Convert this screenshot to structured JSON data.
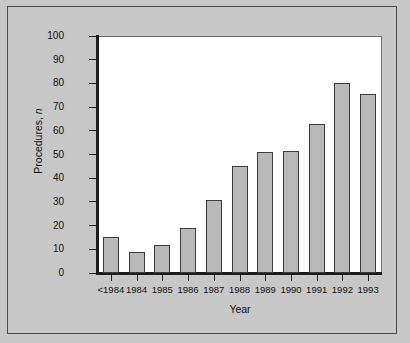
{
  "chart_data": {
    "type": "bar",
    "title": "",
    "xlabel": "Year",
    "ylabel": "Procedures, n",
    "ylabel_prefix": "Procedures, ",
    "ylabel_italic": "n",
    "categories": [
      "<1984",
      "1984",
      "1985",
      "1986",
      "1987",
      "1988",
      "1989",
      "1990",
      "1991",
      "1992",
      "1993"
    ],
    "values": [
      15,
      9,
      12,
      19,
      31,
      45,
      51,
      51.5,
      63,
      80,
      75.5
    ],
    "ylim": [
      0,
      100
    ],
    "ytick_labels": [
      "100",
      "90",
      "80",
      "70",
      "60",
      "50",
      "40",
      "30",
      "20",
      "10",
      "0"
    ],
    "ytick_values": [
      100,
      90,
      80,
      70,
      60,
      50,
      40,
      30,
      20,
      10,
      0
    ],
    "ytick_step": 10,
    "grid": false,
    "legend": null,
    "series": [
      {
        "name": "Procedures",
        "values": [
          15,
          9,
          12,
          19,
          31,
          45,
          51,
          51.5,
          63,
          80,
          75.5
        ]
      }
    ]
  },
  "style": {
    "figure_background": "#c7c7c7",
    "plot_background": "#ffffff",
    "bar_fill": "#b9b9b9",
    "bar_stroke": "#3b3b3b",
    "axis_color": "#1c1c1c",
    "frame_color": "#4a4a4a",
    "text_color": "#111111"
  }
}
